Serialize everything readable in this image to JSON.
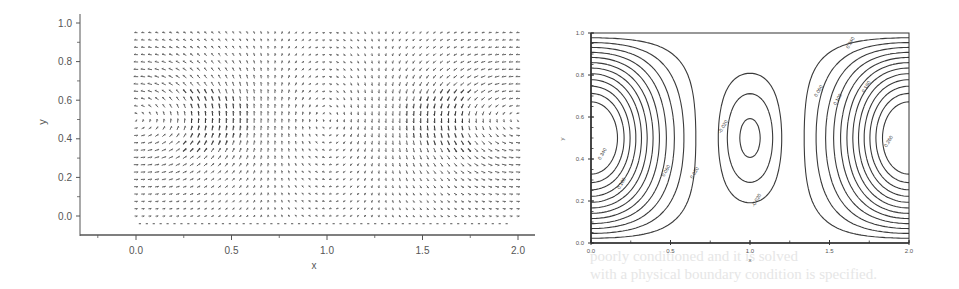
{
  "figure": {
    "background_text_lines": [
      "poorly conditioned and it is solved",
      "with a physical boundary condition is specified."
    ]
  },
  "chart_data": [
    {
      "type": "quiver",
      "title": "",
      "xlabel": "x",
      "ylabel": "y",
      "xlim": [
        -0.1,
        2.1
      ],
      "ylim": [
        -0.1,
        1.0
      ],
      "xticks": [
        "0.0",
        "0.5",
        "1.0",
        "1.5",
        "2.0"
      ],
      "xtick_values": [
        0.0,
        0.5,
        1.0,
        1.5,
        2.0
      ],
      "yticks": [
        "0.0",
        "0.2",
        "0.4",
        "0.6",
        "0.8",
        "1.0"
      ],
      "ytick_values": [
        0.0,
        0.2,
        0.4,
        0.6,
        0.8,
        1.0
      ],
      "grid": false,
      "field": {
        "description": "Velocity vector field of three counter-rotating cells; strong vortices centered near x=0.0 and x=2.0 at y=0.5, weak cell near x=1.0",
        "x_range": [
          0.0,
          2.0
        ],
        "y_range": [
          0.0,
          0.95
        ],
        "nx": 56,
        "ny": 26,
        "vortex_centers": [
          {
            "x": 0.0,
            "y": 0.5,
            "strength": 1.0
          },
          {
            "x": 1.0,
            "y": 0.5,
            "strength": -0.3
          },
          {
            "x": 2.0,
            "y": 0.5,
            "strength": 1.0
          }
        ]
      }
    },
    {
      "type": "contour",
      "title": "",
      "xlabel": "x",
      "ylabel": "y",
      "xlim": [
        0.0,
        2.0
      ],
      "ylim": [
        0.0,
        1.0
      ],
      "xticks": [
        "0.0",
        "0.5",
        "1.0",
        "1.5",
        "2.0"
      ],
      "xtick_values": [
        0.0,
        0.5,
        1.0,
        1.5,
        2.0
      ],
      "yticks": [
        "0.0",
        "0.2",
        "0.4",
        "0.6",
        "0.8",
        "1.0"
      ],
      "ytick_values": [
        0.0,
        0.2,
        0.4,
        0.6,
        0.8,
        1.0
      ],
      "grid": false,
      "line_style": "dash-dot",
      "levels": [
        0.02,
        0.04,
        0.06,
        0.08,
        0.1,
        0.12,
        0.14,
        0.16,
        0.18,
        0.2,
        0.22,
        0.24,
        -0.01,
        -0.02,
        -0.03
      ],
      "contour_labels": [
        {
          "text": "0.340",
          "x": 0.08,
          "y": 0.42
        },
        {
          "text": "0.100",
          "x": 0.2,
          "y": 0.28
        },
        {
          "text": "0.060",
          "x": 0.48,
          "y": 0.34
        },
        {
          "text": "0.020",
          "x": 0.66,
          "y": 0.33
        },
        {
          "text": "-0.020",
          "x": 0.84,
          "y": 0.55
        },
        {
          "text": "-0.020",
          "x": 1.05,
          "y": 0.2
        },
        {
          "text": "0.340",
          "x": 1.64,
          "y": 0.95
        },
        {
          "text": "0.060",
          "x": 1.44,
          "y": 0.72
        },
        {
          "text": "0.100",
          "x": 1.56,
          "y": 0.68
        },
        {
          "text": "0.180",
          "x": 1.74,
          "y": 0.74
        },
        {
          "text": "0.260",
          "x": 1.88,
          "y": 0.48
        }
      ]
    }
  ]
}
